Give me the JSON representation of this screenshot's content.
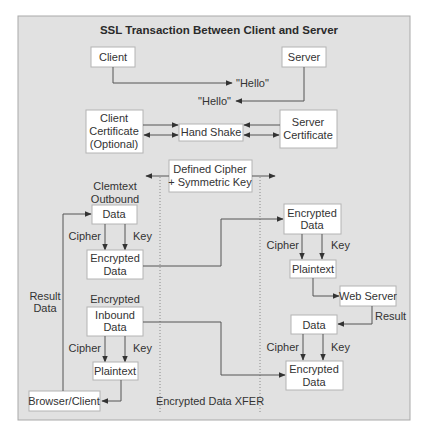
{
  "title": "SSL Transaction Between Client and Server",
  "colors": {
    "panel": "#e1e1e1",
    "box": "#ffffff",
    "line": "#555555",
    "text": "#333333"
  },
  "nodes": {
    "client": {
      "label": [
        "Client"
      ]
    },
    "server": {
      "label": [
        "Server"
      ]
    },
    "client_cert": {
      "label": [
        "Client",
        "Certificate",
        "(Optional)"
      ]
    },
    "handshake": {
      "label": [
        "Hand Shake"
      ]
    },
    "server_cert": {
      "label": [
        "Server",
        "Certificate"
      ]
    },
    "cipher_key": {
      "label": [
        "Defined Cipher",
        "+ Symmetric Key"
      ]
    },
    "out_data": {
      "label": [
        "Data"
      ]
    },
    "out_encrypted": {
      "label": [
        "Encrypted",
        "Data"
      ]
    },
    "in_data": {
      "label": [
        "Inbound",
        "Data"
      ]
    },
    "in_plaintext": {
      "label": [
        "Plaintext"
      ]
    },
    "browser_client": {
      "label": [
        "Browser/Client"
      ]
    },
    "srv_encrypted": {
      "label": [
        "Encrypted",
        "Data"
      ]
    },
    "srv_plaintext": {
      "label": [
        "Plaintext"
      ]
    },
    "web_server": {
      "label": [
        "Web Server"
      ]
    },
    "srv_data": {
      "label": [
        "Data"
      ]
    },
    "srv_encrypted_out": {
      "label": [
        "Encrypted",
        "Data"
      ]
    }
  },
  "labels": {
    "hello_to_server": "\"Hello\"",
    "hello_to_client": "\"Hello\"",
    "clemtext": "Clemtext",
    "outbound": "Outbound",
    "encrypted_heading": "Encrypted",
    "result_data_1": "Result",
    "result_data_2": "Data",
    "result": "Result",
    "xfer": "Encrypted Data XFER",
    "cipher": "Cipher",
    "key": "Key"
  },
  "edges": [
    {
      "from": "client",
      "to": "hello_to_server"
    },
    {
      "from": "server",
      "to": "hello_to_client"
    },
    {
      "from": "client_cert",
      "to": "handshake",
      "bidirectional": true
    },
    {
      "from": "server_cert",
      "to": "handshake",
      "bidirectional": true
    },
    {
      "from": "out_data",
      "to": "out_encrypted",
      "labels": [
        "Cipher",
        "Key"
      ]
    },
    {
      "from": "out_encrypted",
      "to": "srv_encrypted"
    },
    {
      "from": "srv_encrypted",
      "to": "srv_plaintext",
      "labels": [
        "Cipher",
        "Key"
      ]
    },
    {
      "from": "srv_plaintext",
      "to": "web_server"
    },
    {
      "from": "web_server",
      "to": "srv_data",
      "label": "Result"
    },
    {
      "from": "srv_data",
      "to": "srv_encrypted_out",
      "labels": [
        "Cipher",
        "Key"
      ]
    },
    {
      "from": "in_data",
      "to": "srv_encrypted_out"
    },
    {
      "from": "in_data",
      "to": "in_plaintext",
      "labels": [
        "Cipher",
        "Key"
      ]
    },
    {
      "from": "in_plaintext",
      "to": "browser_client"
    },
    {
      "from": "browser_client",
      "to": "out_data",
      "label": "Result Data"
    }
  ]
}
